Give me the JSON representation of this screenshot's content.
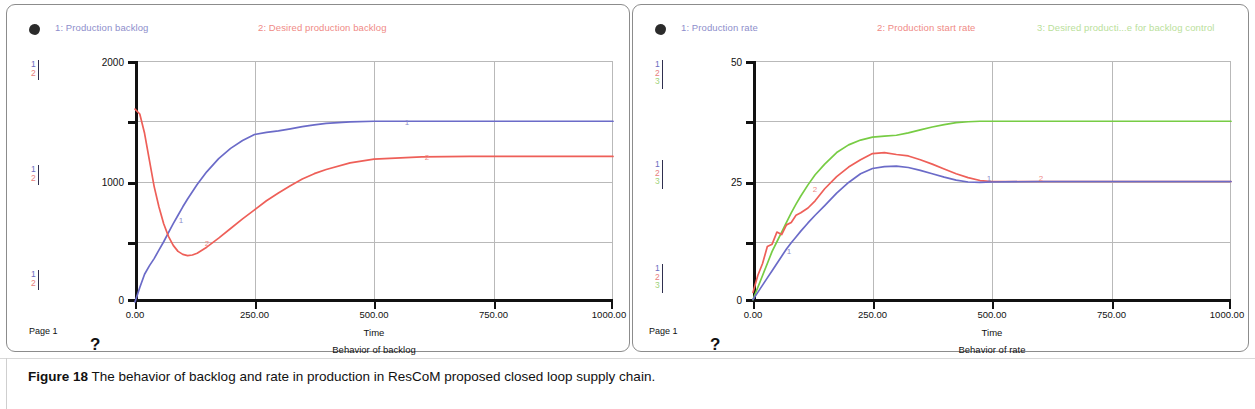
{
  "figure": {
    "number_label": "Figure 18",
    "caption": "The behavior of backlog and rate in production in ResCoM proposed closed loop supply chain."
  },
  "panels": [
    {
      "id": "backlog",
      "page_label": "Page 1",
      "help_glyph": "?",
      "chart_title": "Behavior of backlog",
      "xlabel": "Time",
      "legend": [
        {
          "num": "1",
          "label": "1: Production backlog",
          "color": "#8e8ecb"
        },
        {
          "num": "2",
          "label": "2: Desired production  backlog",
          "color": "#ef8a86"
        }
      ],
      "y_ticks": [
        "2000",
        "1000",
        "0"
      ],
      "x_ticks": [
        "0.00",
        "250.00",
        "500.00",
        "750.00",
        "1000.00"
      ],
      "scale_markers": [
        {
          "rows": [
            "1",
            "2"
          ]
        },
        {
          "rows": [
            "1",
            "2"
          ]
        },
        {
          "rows": [
            "1",
            "2"
          ]
        }
      ],
      "curve_tags": [
        {
          "num": "1",
          "color": "#8e8ecb"
        },
        {
          "num": "2",
          "color": "#ef8a86"
        }
      ]
    },
    {
      "id": "rate",
      "page_label": "Page 1",
      "help_glyph": "?",
      "chart_title": "Behavior of rate",
      "xlabel": "Time",
      "legend": [
        {
          "num": "1",
          "label": "1: Production  rate",
          "color": "#8e8ecb"
        },
        {
          "num": "2",
          "label": "2: Production start rate",
          "color": "#ef8a86"
        },
        {
          "num": "3",
          "label": "3: Desired producti...e for backlog control",
          "color": "#b9e09a"
        }
      ],
      "y_ticks": [
        "50",
        "25",
        "0"
      ],
      "x_ticks": [
        "0.00",
        "250.00",
        "500.00",
        "750.00",
        "1000.00"
      ],
      "scale_markers": [
        {
          "rows": [
            "1",
            "2",
            "3"
          ]
        },
        {
          "rows": [
            "1",
            "2",
            "3"
          ]
        },
        {
          "rows": [
            "1",
            "2",
            "3"
          ]
        }
      ],
      "curve_tags": [
        {
          "num": "1",
          "color": "#8e8ecb"
        },
        {
          "num": "2",
          "color": "#ef8a86"
        },
        {
          "num": "3",
          "color": "#b9e09a"
        }
      ]
    }
  ],
  "colors": {
    "series1_blue": "#6b6bc8",
    "series2_red": "#ee5f58",
    "series3_green": "#77cc44",
    "axis_black": "#111111",
    "grid_gray": "#b9b9b9",
    "panel_border": "#8c8c8c"
  },
  "chart_data": [
    {
      "type": "line",
      "title": "Behavior of backlog",
      "xlabel": "Time",
      "ylabel": "",
      "xlim": [
        0,
        1000
      ],
      "ylim": [
        0,
        2000
      ],
      "xticks": [
        0,
        250,
        500,
        750,
        1000
      ],
      "yticks": [
        0,
        1000,
        2000
      ],
      "grid": true,
      "legend_position": "top",
      "x": [
        0,
        10,
        20,
        30,
        40,
        50,
        60,
        70,
        80,
        90,
        100,
        110,
        120,
        130,
        150,
        175,
        200,
        225,
        250,
        275,
        300,
        325,
        350,
        375,
        400,
        450,
        500,
        600,
        700,
        800,
        900,
        1000
      ],
      "series": [
        {
          "name": "1: Production backlog",
          "color": "#6b6bc8",
          "values": [
            0,
            120,
            230,
            300,
            360,
            430,
            500,
            575,
            650,
            720,
            790,
            855,
            915,
            975,
            1080,
            1190,
            1275,
            1340,
            1390,
            1408,
            1420,
            1437,
            1455,
            1470,
            1482,
            1495,
            1500,
            1500,
            1500,
            1500,
            1500,
            1500
          ]
        },
        {
          "name": "2: Desired production  backlog",
          "color": "#ee5f58",
          "values": [
            1600,
            1560,
            1400,
            1180,
            960,
            790,
            650,
            545,
            470,
            420,
            395,
            385,
            390,
            405,
            455,
            530,
            610,
            690,
            765,
            840,
            905,
            965,
            1020,
            1065,
            1100,
            1155,
            1185,
            1205,
            1208,
            1208,
            1208,
            1208
          ]
        }
      ]
    },
    {
      "type": "line",
      "title": "Behavior of rate",
      "xlabel": "Time",
      "ylabel": "",
      "xlim": [
        0,
        1000
      ],
      "ylim": [
        0,
        50
      ],
      "xticks": [
        0,
        250,
        500,
        750,
        1000
      ],
      "yticks": [
        0,
        25,
        50
      ],
      "grid": true,
      "legend_position": "top",
      "x": [
        0,
        10,
        20,
        30,
        40,
        50,
        60,
        70,
        80,
        90,
        100,
        115,
        130,
        150,
        175,
        200,
        225,
        250,
        275,
        300,
        325,
        350,
        375,
        400,
        425,
        450,
        475,
        500,
        600,
        700,
        800,
        900,
        1000
      ],
      "series": [
        {
          "name": "1: Production  rate",
          "color": "#6b6bc8",
          "values": [
            0.5,
            2.0,
            3.5,
            5.0,
            6.5,
            8.0,
            9.5,
            11.0,
            12.3,
            13.5,
            14.7,
            16.4,
            18.0,
            20.0,
            22.6,
            24.8,
            26.6,
            27.7,
            28.1,
            28.2,
            27.9,
            27.3,
            26.6,
            25.9,
            25.3,
            24.9,
            24.8,
            24.9,
            25.0,
            25.0,
            25.0,
            25.0,
            25.0
          ]
        },
        {
          "name": "2: Production start rate",
          "color": "#ee5f58",
          "values": [
            2.0,
            5.5,
            8.0,
            11.5,
            12.0,
            14.5,
            14.0,
            16.0,
            16.5,
            18.0,
            18.5,
            19.5,
            21.0,
            23.5,
            26.0,
            28.0,
            29.5,
            30.8,
            31.0,
            30.6,
            30.3,
            29.5,
            28.6,
            27.6,
            26.6,
            25.8,
            25.2,
            25.0,
            25.0,
            25.0,
            25.0,
            25.0,
            25.0
          ]
        },
        {
          "name": "3: Desired producti...e for backlog control",
          "color": "#77cc44",
          "values": [
            0.5,
            3.0,
            5.5,
            8.0,
            10.5,
            12.5,
            14.5,
            16.5,
            18.5,
            20.3,
            22.0,
            24.3,
            26.4,
            28.6,
            31.0,
            32.6,
            33.6,
            34.2,
            34.4,
            34.6,
            35.1,
            35.7,
            36.3,
            36.8,
            37.2,
            37.4,
            37.5,
            37.5,
            37.5,
            37.5,
            37.5,
            37.5,
            37.5
          ]
        }
      ]
    }
  ]
}
